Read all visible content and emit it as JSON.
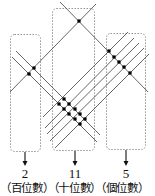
{
  "colors": {
    "line": "#555555",
    "dot": "#000000",
    "box": "#888888",
    "text": "#111111"
  },
  "groups": [
    {
      "name": "hundreds",
      "result": "2",
      "label": "(百位數)"
    },
    {
      "name": "tens",
      "result": "11",
      "label": "(十位數)"
    },
    {
      "name": "ones",
      "result": "5",
      "label": "(個位數)"
    }
  ],
  "label_row": "（百位數）（十位數）（個位數）",
  "lines": {
    "falling": [
      {
        "id": "long",
        "x1": 60,
        "y1": 2,
        "x2": 148,
        "y2": 92
      },
      {
        "id": "upper-pair",
        "x1": 16,
        "y1": 51,
        "x2": 100,
        "y2": 135
      },
      {
        "id": "lower-pair",
        "x1": 12,
        "y1": 57,
        "x2": 97,
        "y2": 142
      }
    ],
    "rising": [
      {
        "id": "single",
        "x1": 10,
        "y1": 92,
        "x2": 96,
        "y2": 4
      },
      {
        "id": "r1",
        "x1": 43,
        "y1": 117,
        "x2": 128,
        "y2": 32
      },
      {
        "id": "r2",
        "x1": 45,
        "y1": 128,
        "x2": 134,
        "y2": 38
      },
      {
        "id": "r3",
        "x1": 47,
        "y1": 134,
        "x2": 139,
        "y2": 43
      },
      {
        "id": "r4",
        "x1": 50,
        "y1": 141,
        "x2": 144,
        "y2": 48
      },
      {
        "id": "r5",
        "x1": 55,
        "y1": 148,
        "x2": 149,
        "y2": 54
      }
    ]
  },
  "dots": [
    [
      79,
      21
    ],
    [
      34,
      68
    ],
    [
      29,
      74
    ],
    [
      109,
      51
    ],
    [
      114,
      57
    ],
    [
      119,
      62
    ],
    [
      124,
      67
    ],
    [
      130,
      73
    ],
    [
      64,
      99
    ],
    [
      69,
      104
    ],
    [
      75,
      109
    ],
    [
      80,
      114
    ],
    [
      85,
      119
    ],
    [
      59,
      104
    ],
    [
      64,
      109
    ],
    [
      69,
      114
    ],
    [
      75,
      119
    ],
    [
      80,
      124
    ]
  ],
  "boxes": [
    {
      "name": "hundreds-box",
      "x": 10,
      "y": 34,
      "w": 30,
      "h": 117
    },
    {
      "name": "tens-box",
      "x": 52,
      "y": 8,
      "w": 42,
      "h": 142
    },
    {
      "name": "ones-box",
      "x": 106,
      "y": 33,
      "w": 39,
      "h": 116
    }
  ],
  "arrows": [
    {
      "x": 25,
      "y1": 152,
      "y2": 166
    },
    {
      "x": 75,
      "y1": 151,
      "y2": 166
    },
    {
      "x": 126,
      "y1": 150,
      "y2": 166
    }
  ]
}
